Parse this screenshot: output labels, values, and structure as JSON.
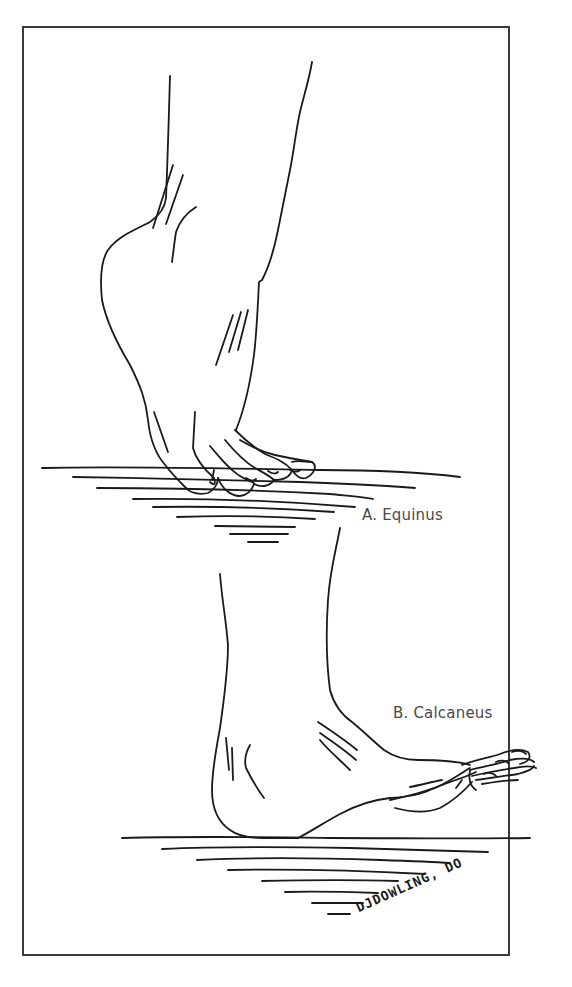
{
  "figure": {
    "labels": {
      "a": "A. Equinus",
      "b": "B. Calcaneus"
    },
    "signature": "DJDOWLING, DO",
    "colors": {
      "ink": "#1a1a1a",
      "label": "#4a4a4a",
      "border": "#3a3a3a",
      "background": "#ffffff"
    }
  }
}
